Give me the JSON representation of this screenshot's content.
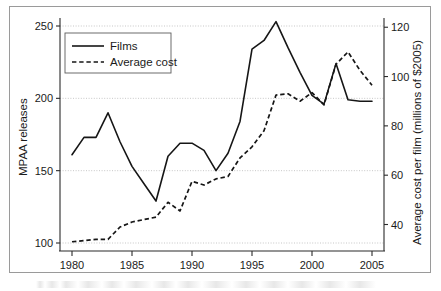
{
  "chart_data": {
    "type": "line",
    "title": "",
    "subtitle": "",
    "xlabel": "",
    "ylabel": "MPAA releases",
    "y2label": "Average cost per film (millions of $2005)",
    "grid": true,
    "legend_position": "top-left",
    "xlim": [
      1979,
      2006
    ],
    "ylim": [
      95,
      258
    ],
    "y2lim": [
      31,
      122
    ],
    "x": [
      1980,
      1981,
      1982,
      1983,
      1984,
      1985,
      1986,
      1987,
      1988,
      1989,
      1990,
      1991,
      1992,
      1993,
      1994,
      1995,
      1996,
      1997,
      1998,
      1999,
      2000,
      2001,
      2002,
      2003,
      2004,
      2005
    ],
    "xticks": [
      1980,
      1985,
      1990,
      1995,
      2000,
      2005
    ],
    "xticklabels": [
      "1980",
      "1985",
      "1990",
      "1995",
      "2000",
      "2005"
    ],
    "yticks": [
      100,
      150,
      200,
      250
    ],
    "yticklabels": [
      "100",
      "150",
      "200",
      "250"
    ],
    "y2ticks": [
      40,
      60,
      80,
      100,
      120
    ],
    "y2ticklabels": [
      "40",
      "60",
      "80",
      "100",
      "120"
    ],
    "series": [
      {
        "name": "Films",
        "axis": "left",
        "style": "solid",
        "color": "#161616",
        "values": [
          161,
          173,
          173,
          190,
          170,
          153,
          141,
          129,
          160,
          169,
          169,
          164,
          150,
          162,
          184,
          234,
          240,
          253,
          235,
          218,
          202,
          196,
          224,
          199,
          198,
          198
        ]
      },
      {
        "name": "Average cost",
        "axis": "right",
        "style": "dashed",
        "color": "#161616",
        "values": [
          33,
          33.5,
          34,
          34,
          39,
          41,
          42,
          43,
          49,
          45.5,
          57.5,
          56,
          58.5,
          59.5,
          67,
          71.5,
          78,
          92.5,
          93,
          90,
          93.5,
          88.5,
          105,
          110,
          102.5,
          96.5
        ]
      }
    ]
  },
  "axes": {
    "left_title": "MPAA releases",
    "right_title": "Average cost per film (millions of $2005)"
  },
  "legend": {
    "items": [
      {
        "label": "Films",
        "style": "solid"
      },
      {
        "label": "Average cost",
        "style": "dashed"
      }
    ]
  }
}
